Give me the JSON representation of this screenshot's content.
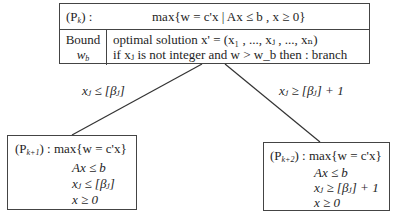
{
  "root": {
    "label": "(P",
    "label_sub": "k",
    "label_suffix": ") :",
    "objective": "max{w = c'x | Ax ≤ b , x ≥ 0}",
    "bound_label": "Bound",
    "bound_var": "w",
    "bound_sub": "b",
    "line1": "optimal solution  x' = (x₁ , ..., xⱼ , ..., xₙ)",
    "line2": "if xⱼ is not integer and w > w_b then : branch"
  },
  "edges": {
    "left_label": "xⱼ ≤ [βⱼ]",
    "right_label": "xⱼ ≥ [βⱼ] + 1"
  },
  "left_child": {
    "label": "(P",
    "label_sub": "k+1",
    "header": ") : max{w = c'x}",
    "constraints": [
      "Ax ≤ b",
      "xⱼ ≤ [βⱼ]",
      "x ≥ 0"
    ]
  },
  "right_child": {
    "label": "(P",
    "label_sub": "k+2",
    "header": ") : max{w = c'x}",
    "constraints": [
      "Ax ≤ b",
      "xⱼ ≥ [βⱼ] + 1",
      "x ≥ 0"
    ]
  }
}
